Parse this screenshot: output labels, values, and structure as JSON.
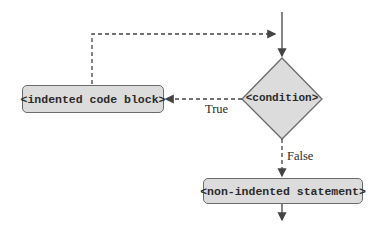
{
  "diagram": {
    "type": "flowchart",
    "nodes": {
      "indented_block": "<indented code block>",
      "condition": "<condition>",
      "non_indented": "<non-indented statement>"
    },
    "edge_labels": {
      "true": "True",
      "false": "False"
    },
    "colors": {
      "node_fill": "#dcdcdc",
      "stroke": "#6b6b6b",
      "text": "#2a2a2a"
    }
  }
}
